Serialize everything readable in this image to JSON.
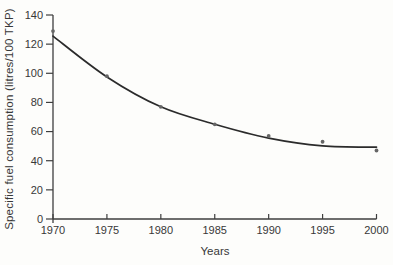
{
  "chart_data": {
    "type": "scatter",
    "title": "",
    "xlabel": "Years",
    "ylabel": "Specific fuel consumption (litres/100 TKP)",
    "x": [
      1970,
      1975,
      1980,
      1985,
      1990,
      1995,
      2000
    ],
    "series": [
      {
        "name": "observed-points",
        "type": "scatter",
        "values": [
          129,
          98,
          77,
          65,
          57,
          53,
          47
        ]
      },
      {
        "name": "trend-curve",
        "type": "line",
        "values": [
          125.5,
          97.5,
          77,
          65,
          55.5,
          50.2,
          49.3
        ]
      }
    ],
    "xlim": [
      1970,
      2000
    ],
    "ylim": [
      0,
      140
    ],
    "xticks": [
      1970,
      1975,
      1980,
      1985,
      1990,
      1995,
      2000
    ],
    "yticks": [
      0,
      20,
      40,
      60,
      80,
      100,
      120,
      140
    ],
    "grid": false,
    "legend": "none",
    "colors": {
      "curve": "#2b2b2b",
      "points": "#666666",
      "axis": "#3e3e3e",
      "text": "#383838",
      "background": "#fdfdfb"
    }
  }
}
